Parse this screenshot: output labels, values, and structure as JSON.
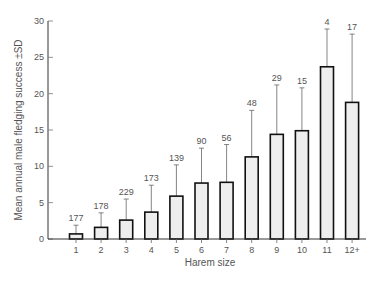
{
  "chart_data": {
    "type": "bar",
    "title": "",
    "xlabel": "Harem size",
    "ylabel": "Mean annual male fledging success ±SD",
    "ylim": [
      0,
      30
    ],
    "yticks": [
      0,
      5,
      10,
      15,
      20,
      25,
      30
    ],
    "grid": false,
    "legend": null,
    "categories": [
      "1",
      "2",
      "3",
      "4",
      "5",
      "6",
      "7",
      "8",
      "9",
      "10",
      "11",
      "12+"
    ],
    "values": [
      0.7,
      1.6,
      2.6,
      3.7,
      5.9,
      7.7,
      7.8,
      11.3,
      14.4,
      14.9,
      23.7,
      18.8
    ],
    "error_upper": [
      1.9,
      3.6,
      5.5,
      7.4,
      10.2,
      12.5,
      13.0,
      17.7,
      21.2,
      20.8,
      28.9,
      28.2
    ],
    "sample_sizes": [
      "177",
      "178",
      "229",
      "173",
      "139",
      "90",
      "56",
      "48",
      "29",
      "15",
      "4",
      "17"
    ],
    "annotations": "Sample sizes shown above error bars"
  }
}
